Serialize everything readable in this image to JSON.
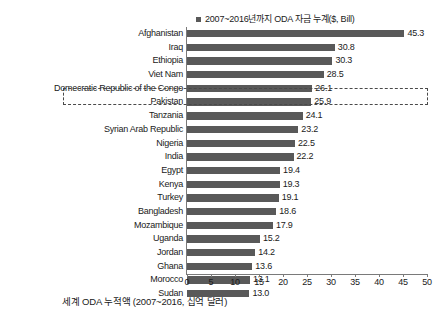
{
  "chart_data": {
    "type": "bar",
    "orientation": "horizontal",
    "title": "",
    "legend": {
      "position": "top",
      "entries": [
        {
          "label": "2007~2016년까지 ODA 자금 누계($, Bill)",
          "color": "#595959"
        }
      ]
    },
    "categories": [
      "Afghanistan",
      "Iraq",
      "Ethiopia",
      "Viet Nam",
      "Domecratic Republic of the Congo",
      "Pakistan",
      "Tanzania",
      "Syrian Arab Republic",
      "Nigeria",
      "India",
      "Egypt",
      "Kenya",
      "Turkey",
      "Bangladesh",
      "Mozambique",
      "Uganda",
      "Jordan",
      "Ghana",
      "Morocco",
      "Sudan"
    ],
    "values": [
      45.3,
      30.8,
      30.3,
      28.5,
      26.1,
      25.9,
      24.1,
      23.2,
      22.5,
      22.2,
      19.4,
      19.3,
      19.1,
      18.6,
      17.9,
      15.2,
      14.2,
      13.6,
      13.1,
      13.0
    ],
    "value_labels": [
      "45.3",
      "30.8",
      "30.3",
      "28.5",
      "26.1",
      "25.9",
      "24.1",
      "23.2",
      "22.5",
      "22.2",
      "19.4",
      "19.3",
      "19.1",
      "18.6",
      "17.9",
      "15.2",
      "14.2",
      "13.6",
      "13.1",
      "13.0"
    ],
    "xlabel": "",
    "ylabel": "",
    "xlim": [
      0,
      50
    ],
    "xticks": [
      0,
      5,
      10,
      15,
      20,
      25,
      30,
      35,
      40,
      45,
      50
    ],
    "xtick_labels": [
      "0",
      "5",
      "10",
      "15",
      "20",
      "25",
      "30",
      "35",
      "40",
      "45",
      "50"
    ],
    "grid": false,
    "bar_color": "#595959",
    "highlight": {
      "category": "Viet Nam",
      "style": "dashed-rectangle",
      "color": "#4a4a4a"
    },
    "caption": "세계 ODA 누적액 (2007~2016, 십억 달러)"
  }
}
